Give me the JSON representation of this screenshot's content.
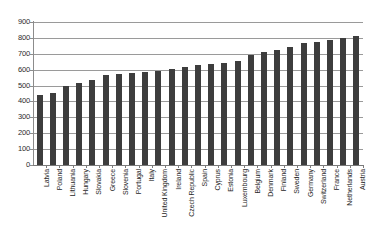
{
  "chart_data": {
    "type": "bar",
    "title": "",
    "subtitle": "",
    "xlabel": "",
    "ylabel": "",
    "ylim": [
      0,
      900
    ],
    "ytick_step": 100,
    "yticks": [
      0,
      100,
      200,
      300,
      400,
      500,
      600,
      700,
      800,
      900
    ],
    "ytick_labels": [
      "0",
      "100",
      "200",
      "300",
      "400",
      "500",
      "600",
      "700",
      "800",
      "900"
    ],
    "grid": true,
    "grid_axis": "y",
    "legend": false,
    "legend_position": "none",
    "bar_color": "#3d3d3d",
    "gridline_color": "#9a9a9a",
    "axis_color": "#8c8c8c",
    "xtick_label_rotation": -90,
    "categories": [
      "Latvia",
      "Poland",
      "Lithuania",
      "Hungary",
      "Slovakia",
      "Greece",
      "Slovenia",
      "Portugal",
      "Italy",
      "United Kingdom",
      "Ireland",
      "Czech Republic",
      "Spain",
      "Cyprus",
      "Estonia",
      "Luxembourg",
      "Belgium",
      "Denmark",
      "Finland",
      "Sweden",
      "Germany",
      "Switzerland",
      "France",
      "Netherlands",
      "Austria"
    ],
    "values": [
      440,
      455,
      500,
      518,
      537,
      565,
      572,
      578,
      588,
      590,
      603,
      620,
      632,
      636,
      641,
      655,
      690,
      712,
      722,
      742,
      770,
      775,
      788,
      800,
      815
    ]
  }
}
